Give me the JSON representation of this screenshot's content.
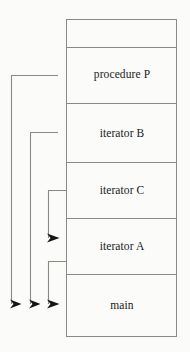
{
  "diagram": {
    "type": "call-stack-diagram",
    "colors": {
      "background": "#fbfbf9",
      "frame_border": "#8a8a82",
      "frame_fill": "#fbfbf9",
      "arrow_stroke": "#8a8a82",
      "arrow_head": "#151515",
      "text": "#1a1a1a"
    },
    "stack": {
      "x": 66,
      "y": 19,
      "width": 111,
      "height": 318,
      "frames": [
        {
          "id": "frame-top-empty",
          "label": "",
          "top": 19,
          "bottom": 47,
          "has_label": false
        },
        {
          "id": "frame-procedure-p",
          "label": "procedure P",
          "top": 47,
          "bottom": 103
        },
        {
          "id": "frame-iterator-b",
          "label": "iterator B",
          "top": 103,
          "bottom": 162
        },
        {
          "id": "frame-iterator-c",
          "label": "iterator C",
          "top": 162,
          "bottom": 218
        },
        {
          "id": "frame-iterator-a",
          "label": "iterator A",
          "top": 218,
          "bottom": 274
        },
        {
          "id": "frame-main",
          "label": "main",
          "top": 274,
          "bottom": 337
        }
      ]
    },
    "arrows": [
      {
        "id": "arrow-procedure-p-to-main",
        "from_frame": "procedure P",
        "to_frame": "main",
        "path": "M 58 75 L 11 75 L 11 304",
        "head_x": 11,
        "head_y": 304,
        "head_dir": "right"
      },
      {
        "id": "arrow-iterator-b-to-main",
        "from_frame": "iterator B",
        "to_frame": "main",
        "path": "M 58 132 L 30 132 L 30 304",
        "head_x": 30,
        "head_y": 304,
        "head_dir": "right"
      },
      {
        "id": "arrow-iterator-c-to-iterator-a",
        "from_frame": "iterator C",
        "to_frame": "iterator A",
        "path": "M 66 190 L 48 190 L 48 238",
        "head_x": 48,
        "head_y": 238,
        "head_dir": "right"
      },
      {
        "id": "arrow-iterator-a-to-main",
        "from_frame": "iterator A",
        "to_frame": "main",
        "path": "M 66 261 L 48 261 L 48 304",
        "head_x": 48,
        "head_y": 304,
        "head_dir": "right"
      }
    ]
  }
}
